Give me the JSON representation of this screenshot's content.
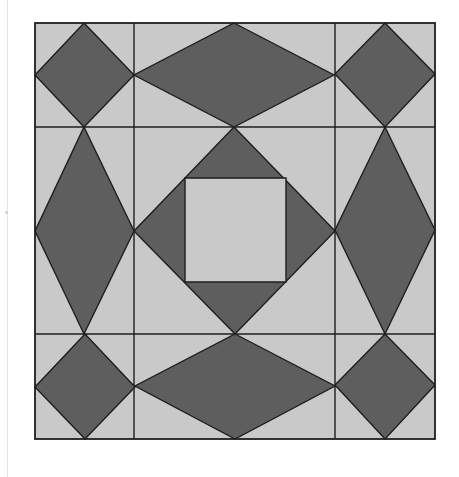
{
  "diagram": {
    "title": "",
    "canvas": {
      "width": 459,
      "height": 477
    },
    "colors": {
      "light_fill": "#c9c9c9",
      "dark_fill": "#5e5e5e",
      "stroke": "#1e1e1e",
      "background": "#ffffff"
    },
    "outer_square": {
      "x1": 35,
      "y1": 23,
      "x2": 435,
      "y2": 439
    },
    "grid_lines": {
      "vertical_x": [
        134,
        335
      ],
      "horizontal_y": [
        127,
        334
      ]
    },
    "dark_shapes": [
      {
        "name": "corner-diamond-top-left",
        "points": [
          [
            84,
            23
          ],
          [
            134,
            75
          ],
          [
            84,
            127
          ],
          [
            35,
            75
          ]
        ]
      },
      {
        "name": "edge-diamond-top",
        "points": [
          [
            234,
            23
          ],
          [
            334,
            75
          ],
          [
            234,
            127
          ],
          [
            134,
            75
          ]
        ]
      },
      {
        "name": "corner-diamond-top-right",
        "points": [
          [
            385,
            23
          ],
          [
            435,
            74
          ],
          [
            385,
            127
          ],
          [
            335,
            74
          ]
        ]
      },
      {
        "name": "edge-diamond-left",
        "points": [
          [
            84,
            127
          ],
          [
            134,
            231
          ],
          [
            84,
            334
          ],
          [
            35,
            231
          ]
        ]
      },
      {
        "name": "center-diamond",
        "points": [
          [
            234,
            127
          ],
          [
            335,
            231
          ],
          [
            235,
            334
          ],
          [
            134,
            231
          ]
        ]
      },
      {
        "name": "edge-diamond-right",
        "points": [
          [
            385,
            127
          ],
          [
            435,
            230
          ],
          [
            385,
            334
          ],
          [
            335,
            230
          ]
        ]
      },
      {
        "name": "corner-diamond-bottom-left",
        "points": [
          [
            85,
            334
          ],
          [
            135,
            387
          ],
          [
            85,
            439
          ],
          [
            35,
            387
          ]
        ]
      },
      {
        "name": "edge-diamond-bottom",
        "points": [
          [
            235,
            334
          ],
          [
            335,
            386
          ],
          [
            235,
            439
          ],
          [
            135,
            386
          ]
        ]
      },
      {
        "name": "corner-diamond-bottom-right",
        "points": [
          [
            385,
            334
          ],
          [
            435,
            385
          ],
          [
            385,
            439
          ],
          [
            335,
            385
          ]
        ]
      }
    ],
    "light_shapes": [
      {
        "name": "center-square",
        "points": [
          [
            185,
            178
          ],
          [
            286,
            178
          ],
          [
            286,
            282
          ],
          [
            185,
            282
          ]
        ]
      }
    ]
  }
}
